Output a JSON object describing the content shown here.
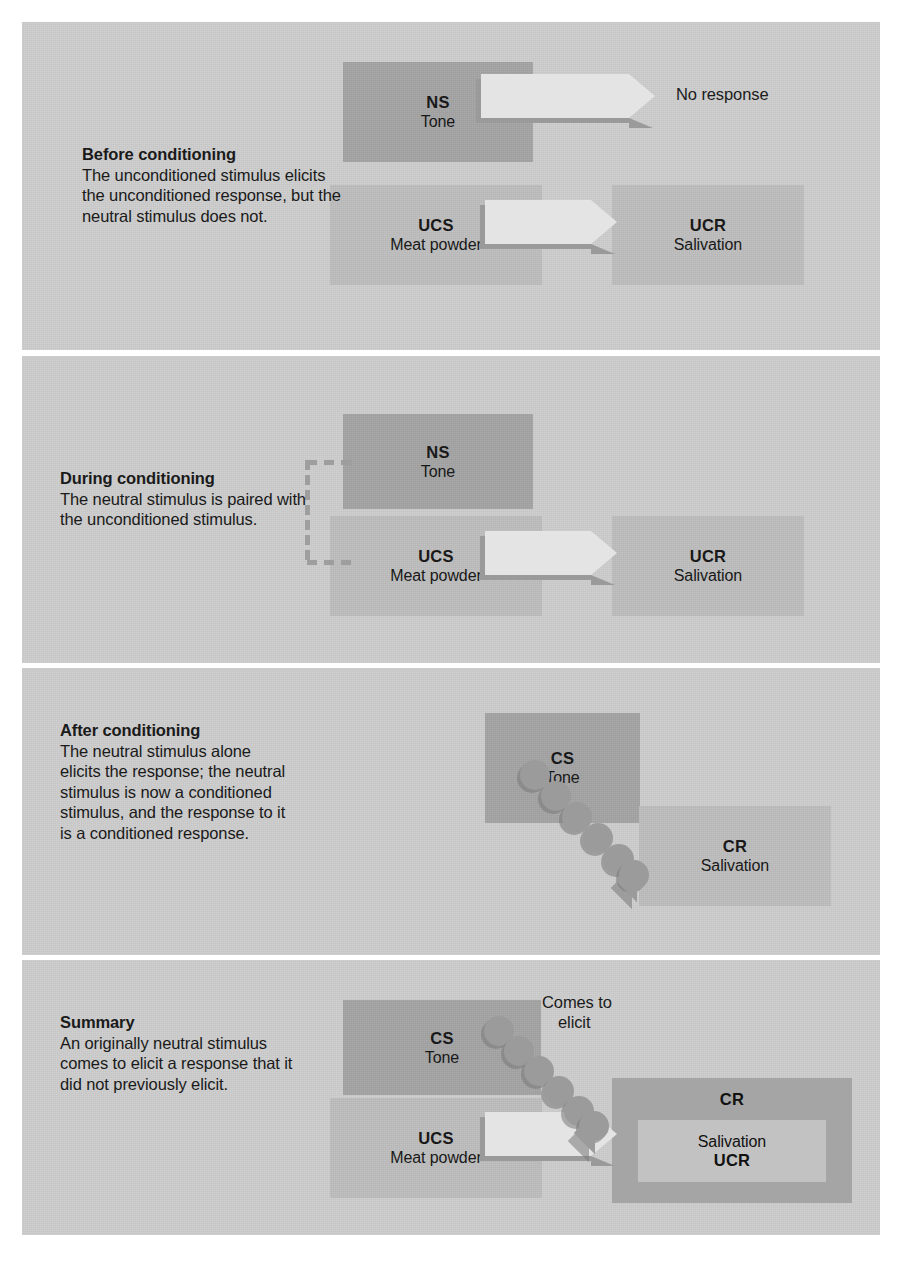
{
  "figure": {
    "background": "#ffffff",
    "panel_bg": "#cdcdcd",
    "box_dark": "#a3a3a3",
    "box_light": "#bdbdbd",
    "arrow_fill": "#e4e4e4",
    "arrow_shadow": "#9a9a9a",
    "dot_color": "#9b9b9b",
    "text_color": "#111111"
  },
  "panels": [
    {
      "id": "before",
      "title": "Before conditioning",
      "body": "The unconditioned stimulus elicits the unconditioned response, but the neutral stimulus does not.",
      "rows": [
        {
          "stimulus": {
            "abbr": "NS",
            "full": "Tone",
            "tone": "dark"
          },
          "arrow": "block-arrow",
          "response": {
            "abbr": "",
            "full": "No response",
            "tone": "none"
          }
        },
        {
          "stimulus": {
            "abbr": "UCS",
            "full": "Meat powder",
            "tone": "light"
          },
          "arrow": "block-arrow",
          "response": {
            "abbr": "UCR",
            "full": "Salivation",
            "tone": "light"
          }
        }
      ]
    },
    {
      "id": "during",
      "title": "During conditioning",
      "body": "The neutral stimulus is paired with the unconditioned stimulus.",
      "pairing_bracket": true,
      "rows": [
        {
          "stimulus": {
            "abbr": "NS",
            "full": "Tone",
            "tone": "dark"
          },
          "arrow": "none",
          "response": null
        },
        {
          "stimulus": {
            "abbr": "UCS",
            "full": "Meat powder",
            "tone": "light"
          },
          "arrow": "block-arrow",
          "response": {
            "abbr": "UCR",
            "full": "Salivation",
            "tone": "light"
          }
        }
      ]
    },
    {
      "id": "after",
      "title": "After conditioning",
      "body": "The neutral stimulus alone elicits the response; the neutral stimulus is now a conditioned stimulus, and the response to it is a conditioned response.",
      "rows": [
        {
          "stimulus": {
            "abbr": "CS",
            "full": "Tone",
            "tone": "dark"
          },
          "arrow": "dotted-diagonal-arrow",
          "response": {
            "abbr": "CR",
            "full": "Salivation",
            "tone": "light"
          }
        }
      ]
    },
    {
      "id": "summary",
      "title": "Summary",
      "body": "An originally neutral stimulus comes to elicit a response that it did not previously elicit.",
      "arrow_label": "Comes to elicit",
      "rows": [
        {
          "stimulus": {
            "abbr": "CS",
            "full": "Tone",
            "tone": "dark"
          },
          "arrow": "dotted-diagonal-arrow",
          "response": {
            "abbr": "CR",
            "full": "",
            "tone": "mid"
          }
        },
        {
          "stimulus": {
            "abbr": "UCS",
            "full": "Meat powder",
            "tone": "light"
          },
          "arrow": "block-arrow",
          "response": {
            "abbr": "UCR",
            "full": "Salivation",
            "tone": "light"
          }
        }
      ]
    }
  ],
  "labels": {
    "ns": "NS",
    "ucs": "UCS",
    "ucr": "UCR",
    "cs": "CS",
    "cr": "CR",
    "tone": "Tone",
    "meat_powder": "Meat powder",
    "salivation": "Salivation",
    "no_response": "No response",
    "comes_to_elicit_line1": "Comes to",
    "comes_to_elicit_line2": "elicit"
  },
  "captions": {
    "before_title": "Before conditioning",
    "before_body": "The unconditioned stimulus elicits the unconditioned response, but the neutral stimulus does not.",
    "during_title": "During conditioning",
    "during_body": "The neutral stimulus is paired with the unconditioned stimulus.",
    "after_title": "After conditioning",
    "after_body": "The neutral stimulus alone elicits the response; the neutral stimulus is now a conditioned stimulus, and the response to it is a conditioned response.",
    "summary_title": "Summary",
    "summary_body": "An originally neutral stimulus comes to elicit a response that it did not previously elicit."
  }
}
